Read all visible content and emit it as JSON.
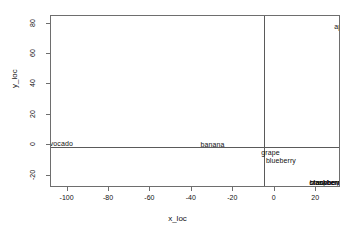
{
  "chart_data": {
    "type": "scatter",
    "title": "",
    "xlabel": "x_loc",
    "ylabel": "y_loc",
    "xlim": [
      -108,
      32
    ],
    "ylim": [
      -28,
      85
    ],
    "grid": false,
    "legend": null,
    "note": "Text-label scatter: each observation drawn as its name instead of a plotting symbol; labels near the panel edge are clipped and several labels in the lower right overlap.",
    "x_ticks": [
      {
        "value": -100,
        "label": "-100"
      },
      {
        "value": -80,
        "label": "-80"
      },
      {
        "value": -60,
        "label": "-60"
      },
      {
        "value": -40,
        "label": "-40"
      },
      {
        "value": -20,
        "label": "-20"
      },
      {
        "value": 0,
        "label": "0"
      },
      {
        "value": 20,
        "label": "20"
      }
    ],
    "y_ticks": [
      {
        "value": 80,
        "label": "80"
      },
      {
        "value": 60,
        "label": "60"
      },
      {
        "value": 40,
        "label": "40"
      },
      {
        "value": 20,
        "label": "20"
      },
      {
        "value": 0,
        "label": "0"
      },
      {
        "value": -20,
        "label": "-20"
      }
    ],
    "reference_lines": [
      {
        "axis": "x",
        "value": 0
      },
      {
        "axis": "y",
        "value": 0
      }
    ],
    "points": [
      {
        "label": "apple",
        "x": 33,
        "y": 78
      },
      {
        "label": "vocado",
        "x": -103,
        "y": 1
      },
      {
        "label": "banana",
        "x": -30,
        "y": 0
      },
      {
        "label": "grape",
        "x": -2,
        "y": -5
      },
      {
        "label": "blueberry",
        "x": 3,
        "y": -10
      },
      {
        "label": "strawberry",
        "x": 25,
        "y": -25
      },
      {
        "label": "blackberry",
        "x": 25,
        "y": -25
      },
      {
        "label": "raspberry",
        "x": 26,
        "y": -25
      },
      {
        "label": "cranberry",
        "x": 24,
        "y": -25
      }
    ]
  }
}
